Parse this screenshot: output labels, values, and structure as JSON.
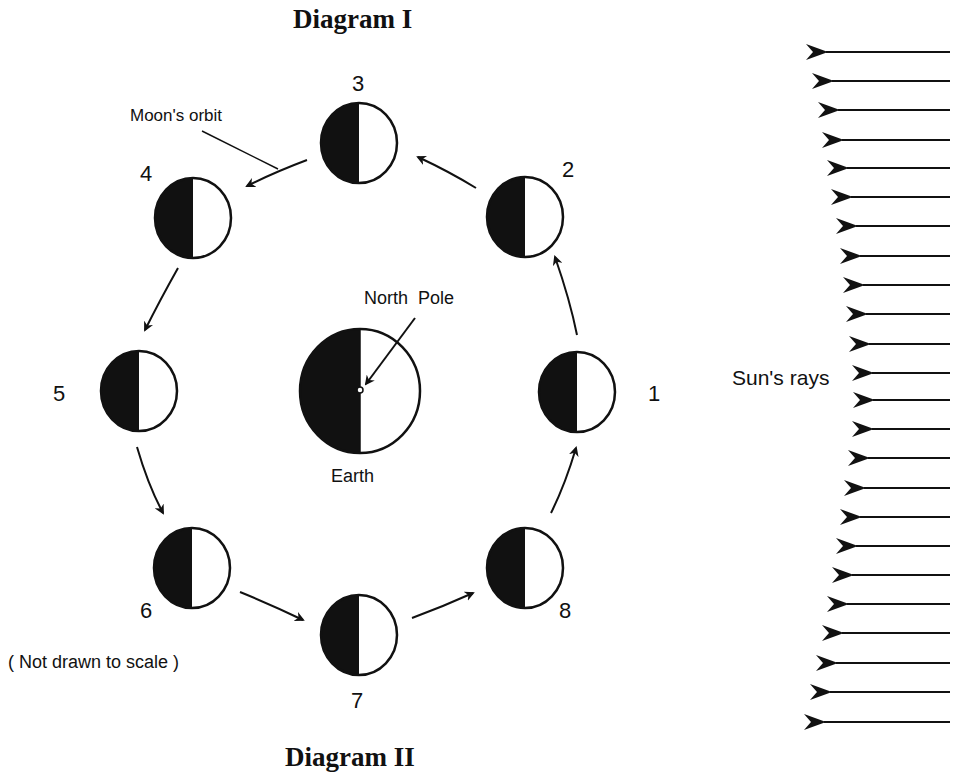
{
  "titles": {
    "top": "Diagram I",
    "bottom": "Diagram II"
  },
  "labels": {
    "moons_orbit": "Moon's orbit",
    "north_pole": "North  Pole",
    "earth": "Earth",
    "suns_rays": "Sun's rays",
    "scale_note": "( Not drawn to scale )"
  },
  "moon_positions": [
    {
      "id": "1",
      "label": "1"
    },
    {
      "id": "2",
      "label": "2"
    },
    {
      "id": "3",
      "label": "3"
    },
    {
      "id": "4",
      "label": "4"
    },
    {
      "id": "5",
      "label": "5"
    },
    {
      "id": "6",
      "label": "6"
    },
    {
      "id": "7",
      "label": "7"
    },
    {
      "id": "8",
      "label": "8"
    }
  ],
  "sun_ray_count": 23,
  "colors": {
    "ink": "#111111",
    "background": "#ffffff"
  }
}
